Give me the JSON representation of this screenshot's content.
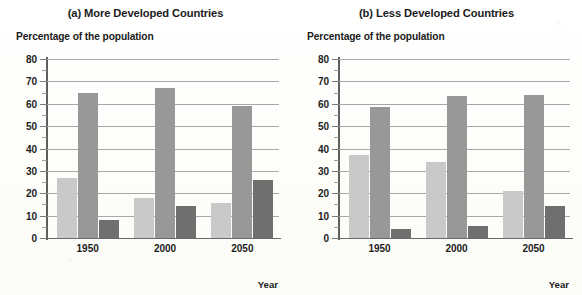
{
  "figure": {
    "background_color": "#fdfdfb",
    "panels": [
      {
        "id": "panel-a",
        "title": "(a) More Developed Countries",
        "ylabel": "Percentage of the population",
        "xlabel": "Year"
      },
      {
        "id": "panel-b",
        "title": "(b) Less Developed Countries",
        "ylabel": "Percentage of the population",
        "xlabel": "Year"
      }
    ]
  },
  "axis": {
    "y_ticks": [
      "80",
      "70",
      "60",
      "50",
      "40",
      "30",
      "20",
      "10",
      "0"
    ],
    "y_tick_values": [
      80,
      70,
      60,
      50,
      40,
      30,
      20,
      10,
      0
    ],
    "y_minor_tick_values": [
      75,
      65,
      55,
      45,
      35,
      25,
      15,
      5
    ],
    "x_ticks": [
      "1950",
      "2000",
      "2050"
    ]
  },
  "series_colors": {
    "light_gray": "#c9c9c9",
    "medium_gray": "#989898",
    "dark_gray": "#6f6f6f"
  },
  "chart_data": [
    {
      "type": "bar",
      "title": "(a) More Developed Countries",
      "xlabel": "Year",
      "ylabel": "Percentage of the population",
      "ylim": [
        0,
        80
      ],
      "y_ticks": [
        0,
        10,
        20,
        30,
        40,
        50,
        60,
        70,
        80
      ],
      "grid": true,
      "legend": "none",
      "categories": [
        "1950",
        "2000",
        "2050"
      ],
      "series": [
        {
          "name": "series-1",
          "color": "#c9c9c9",
          "values": [
            27,
            18,
            15.5
          ]
        },
        {
          "name": "series-2",
          "color": "#989898",
          "values": [
            65,
            67,
            59
          ]
        },
        {
          "name": "series-3",
          "color": "#6f6f6f",
          "values": [
            8,
            14.5,
            26
          ]
        }
      ]
    },
    {
      "type": "bar",
      "title": "(b) Less Developed Countries",
      "xlabel": "Year",
      "ylabel": "Percentage of the population",
      "ylim": [
        0,
        80
      ],
      "y_ticks": [
        0,
        10,
        20,
        30,
        40,
        50,
        60,
        70,
        80
      ],
      "grid": true,
      "legend": "none",
      "categories": [
        "1950",
        "2000",
        "2050"
      ],
      "series": [
        {
          "name": "series-1",
          "color": "#c9c9c9",
          "values": [
            37,
            34,
            21
          ]
        },
        {
          "name": "series-2",
          "color": "#989898",
          "values": [
            58.5,
            63.5,
            64
          ]
        },
        {
          "name": "series-3",
          "color": "#6f6f6f",
          "values": [
            4,
            5.5,
            14.5
          ]
        }
      ]
    }
  ]
}
